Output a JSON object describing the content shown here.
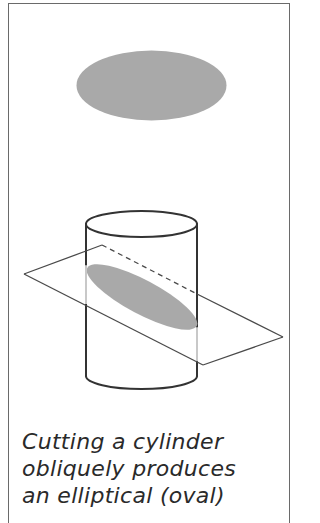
{
  "figure": {
    "colors": {
      "outline": "#3a3a3a",
      "section_fill": "#a9a9a9",
      "hidden_edge": "#c8c8c8",
      "frame": "#6a6a6a"
    },
    "top_ellipse": {
      "cx": 151.5,
      "cy": 85.5,
      "rx": 75,
      "ry": 35
    },
    "cylinder": {
      "left_x": 86,
      "right_x": 197,
      "top_cy": 224,
      "bottom_cy": 376,
      "ry": 13
    },
    "plane": {
      "vertices": [
        [
          24,
          274
        ],
        [
          102,
          245
        ],
        [
          283,
          337
        ],
        [
          203,
          365
        ]
      ]
    }
  },
  "caption": {
    "lines": [
      "Cutting a cylinder",
      "obliquely produces",
      "an elliptical (oval)"
    ]
  }
}
